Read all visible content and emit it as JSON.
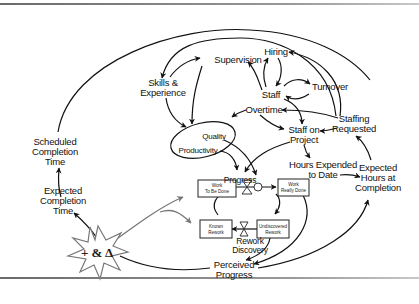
{
  "diagram": {
    "type": "causal-loop / stock-and-flow diagram",
    "variables": {
      "supervision": "Supervision",
      "hiring": "Hiring",
      "skills_line1": "Skills &",
      "skills_line2": "Experience",
      "turnover": "Turnover",
      "staff": "Staff",
      "overtime": "Overtime",
      "quality": "Quality",
      "productivity": "Productivity",
      "staff_on_project_line1": "Staff on",
      "staff_on_project_line2": "Project",
      "staffing_requested_line1": "Staffing",
      "staffing_requested_line2": "Requested",
      "scheduled_line1": "Scheduled",
      "scheduled_line2": "Completion",
      "scheduled_line3": "Time",
      "expected_line1": "Expected",
      "expected_line2": "Completion",
      "expected_line3": "Time",
      "hours_expended_line1": "Hours Expended",
      "hours_expended_line2": "to Date",
      "expected_hours_line1": "Expected",
      "expected_hours_line2": "Hours at",
      "expected_hours_line3": "Completion",
      "progress": "Progress",
      "rework_discovery_line1": "Rework",
      "rework_discovery_line2": "Discovery",
      "perceived_line1": "Perceived",
      "perceived_line2": "Progress"
    },
    "stocks": {
      "work_to_be_done_line1": "Work",
      "work_to_be_done_line2": "To Be Done",
      "work_really_done_line1": "Work",
      "work_really_done_line2": "Really Done",
      "known_rework_line1": "Known",
      "known_rework_line2": "Rework",
      "undiscovered_rework_line1": "Undiscovered",
      "undiscovered_rework_line2": "Rework"
    },
    "disturbance": {
      "label": "+ & Δ",
      "shape": "starburst"
    },
    "colors": {
      "line": "#111111",
      "disturbance_arrows": "#777777",
      "frame": "#7a7a7a"
    }
  }
}
